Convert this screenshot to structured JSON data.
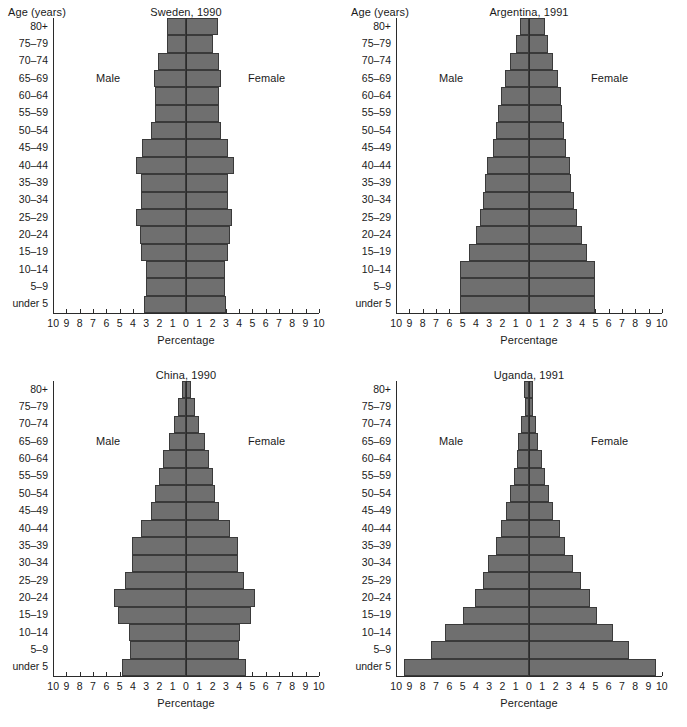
{
  "figure": {
    "x_axis_label": "Percentage",
    "y_axis_label": "Age (years)",
    "male_label": "Male",
    "female_label": "Female",
    "bar_color": "#6f6f6f",
    "bar_edge_color": "#3a3a3a",
    "axis_color": "#2b2b2b",
    "background": "#ffffff",
    "tick_labels": [
      "10",
      "9",
      "8",
      "7",
      "6",
      "5",
      "4",
      "3",
      "2",
      "1",
      "0",
      "1",
      "2",
      "3",
      "4",
      "5",
      "6",
      "7",
      "8",
      "9",
      "10"
    ],
    "age_groups": [
      "80+",
      "75–79",
      "70–74",
      "65–69",
      "60–64",
      "55–59",
      "50–54",
      "45–49",
      "40–44",
      "35–39",
      "30–34",
      "25–29",
      "20–24",
      "15–19",
      "10–14",
      "5–9",
      "under 5"
    ]
  },
  "chart_data": [
    {
      "type": "bar",
      "title": "Sweden, 1990",
      "show_y_axis_title": true,
      "xlabel": "Percentage",
      "ylabel": "Age (years)",
      "xlim": [
        -10,
        10
      ],
      "grid": false,
      "legend": "inline",
      "categories": [
        "80+",
        "75–79",
        "70–74",
        "65–69",
        "60–64",
        "55–59",
        "50–54",
        "45–49",
        "40–44",
        "35–39",
        "30–34",
        "25–29",
        "20–24",
        "15–19",
        "10–14",
        "5–9",
        "under 5"
      ],
      "series": [
        {
          "name": "Male",
          "values": [
            1.4,
            1.4,
            2.1,
            2.4,
            2.3,
            2.3,
            2.6,
            3.3,
            3.8,
            3.4,
            3.4,
            3.8,
            3.5,
            3.4,
            3.0,
            3.0,
            3.2
          ]
        },
        {
          "name": "Female",
          "values": [
            2.4,
            2.0,
            2.5,
            2.6,
            2.5,
            2.5,
            2.6,
            3.2,
            3.6,
            3.2,
            3.2,
            3.5,
            3.3,
            3.2,
            2.9,
            2.9,
            3.0
          ]
        }
      ]
    },
    {
      "type": "bar",
      "title": "Argentina, 1991",
      "show_y_axis_title": true,
      "xlabel": "Percentage",
      "ylabel": "Age (years)",
      "xlim": [
        -10,
        10
      ],
      "grid": false,
      "legend": "inline",
      "categories": [
        "80+",
        "75–79",
        "70–74",
        "65–69",
        "60–64",
        "55–59",
        "50–54",
        "45–49",
        "40–44",
        "35–39",
        "30–34",
        "25–29",
        "20–24",
        "15–19",
        "10–14",
        "5–9",
        "under 5"
      ],
      "series": [
        {
          "name": "Male",
          "values": [
            0.7,
            1.0,
            1.4,
            1.8,
            2.1,
            2.3,
            2.5,
            2.7,
            3.2,
            3.3,
            3.5,
            3.7,
            4.0,
            4.5,
            5.2,
            5.2,
            5.2
          ]
        },
        {
          "name": "Female",
          "values": [
            1.2,
            1.4,
            1.8,
            2.2,
            2.4,
            2.5,
            2.6,
            2.8,
            3.1,
            3.2,
            3.4,
            3.6,
            4.0,
            4.4,
            5.0,
            5.0,
            5.0
          ]
        }
      ]
    },
    {
      "type": "bar",
      "title": "China, 1990",
      "show_y_axis_title": false,
      "xlabel": "Percentage",
      "ylabel": "Age (years)",
      "xlim": [
        -10,
        10
      ],
      "grid": false,
      "legend": "inline",
      "categories": [
        "80+",
        "75–79",
        "70–74",
        "65–69",
        "60–64",
        "55–59",
        "50–54",
        "45–49",
        "40–44",
        "35–39",
        "30–34",
        "25–29",
        "20–24",
        "15–19",
        "10–14",
        "5–9",
        "under 5"
      ],
      "series": [
        {
          "name": "Male",
          "values": [
            0.3,
            0.6,
            0.9,
            1.3,
            1.7,
            2.0,
            2.3,
            2.6,
            3.4,
            4.1,
            4.1,
            4.6,
            5.4,
            5.1,
            4.3,
            4.2,
            4.8
          ]
        },
        {
          "name": "Female",
          "values": [
            0.4,
            0.7,
            1.0,
            1.4,
            1.7,
            2.0,
            2.2,
            2.5,
            3.3,
            3.9,
            3.9,
            4.4,
            5.2,
            4.9,
            4.1,
            4.0,
            4.5
          ]
        }
      ]
    },
    {
      "type": "bar",
      "title": "Uganda, 1991",
      "show_y_axis_title": false,
      "xlabel": "Percentage",
      "ylabel": "Age (years)",
      "xlim": [
        -10,
        10
      ],
      "grid": false,
      "legend": "inline",
      "categories": [
        "80+",
        "75–79",
        "70–74",
        "65–69",
        "60–64",
        "55–59",
        "50–54",
        "45–49",
        "40–44",
        "35–39",
        "30–34",
        "25–29",
        "20–24",
        "15–19",
        "10–14",
        "5–9",
        "under 5"
      ],
      "series": [
        {
          "name": "Male",
          "values": [
            0.4,
            0.3,
            0.6,
            0.8,
            0.9,
            1.1,
            1.4,
            1.7,
            2.1,
            2.5,
            3.1,
            3.5,
            4.1,
            5.0,
            6.3,
            7.4,
            9.4
          ]
        },
        {
          "name": "Female",
          "values": [
            0.3,
            0.3,
            0.5,
            0.7,
            1.0,
            1.2,
            1.5,
            1.8,
            2.3,
            2.7,
            3.3,
            3.9,
            4.6,
            5.1,
            6.3,
            7.5,
            9.6
          ]
        }
      ]
    }
  ]
}
